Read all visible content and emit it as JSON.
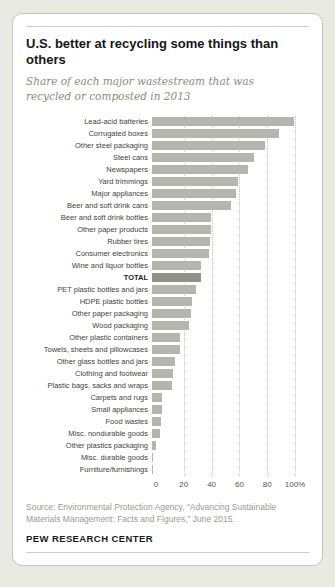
{
  "card": {
    "title": "U.S. better at recycling some things than others",
    "subtitle": "Share of each major wastestream that was recycled or composted in 2013",
    "source": "Source: Environmental Protection Agency, “Advancing Sustainable Materials Management: Facts and Figures,” June 2015.",
    "branding": "PEW RESEARCH CENTER"
  },
  "chart_data": {
    "type": "bar",
    "orientation": "horizontal",
    "title": "U.S. better at recycling some things than others",
    "subtitle": "Share of each major wastestream that was recycled or composted in 2013",
    "xlabel": "",
    "ylabel": "",
    "xlim": [
      0,
      100
    ],
    "grid": "dotted-vertical",
    "unit": "%",
    "bar_color": "#b4b5ad",
    "highlight_color": "#8f9088",
    "highlight_category": "TOTAL",
    "x_ticks": [
      {
        "value": 0,
        "label": "0"
      },
      {
        "value": 20,
        "label": "20"
      },
      {
        "value": 40,
        "label": "40"
      },
      {
        "value": 60,
        "label": "60"
      },
      {
        "value": 80,
        "label": "80"
      },
      {
        "value": 100,
        "label": "100%"
      }
    ],
    "categories": [
      "Lead-acid batteries",
      "Corrugated boxes",
      "Other steel packaging",
      "Steel cans",
      "Newspapers",
      "Yard trimmings",
      "Major appliances",
      "Beer and soft drink cans",
      "Beer and soft drink bottles",
      "Other paper products",
      "Rubber tires",
      "Consumer electronics",
      "Wine and liquor bottles",
      "TOTAL",
      "PET plastic bottles and jars",
      "HDPE plastic bottles",
      "Other paper packaging",
      "Wood packaging",
      "Other plastic containers",
      "Towels, sheets and pillowcases",
      "Other glass bottles and jars",
      "Clothing and footwear",
      "Plastic bags, sacks and wraps",
      "Carpets and rugs",
      "Small appliances",
      "Food wastes",
      "Misc. nondurable goods",
      "Other plastics packaging",
      "Misc. durable goods",
      "Furniture/furnishings"
    ],
    "values": [
      99,
      88.5,
      79,
      71,
      67,
      60,
      59,
      55,
      41.5,
      41.5,
      40.5,
      40,
      34.5,
      34.3,
      31,
      28,
      27,
      26,
      19.5,
      19.5,
      16,
      15,
      14,
      7,
      7,
      6,
      5.5,
      3,
      1,
      0.3
    ]
  }
}
